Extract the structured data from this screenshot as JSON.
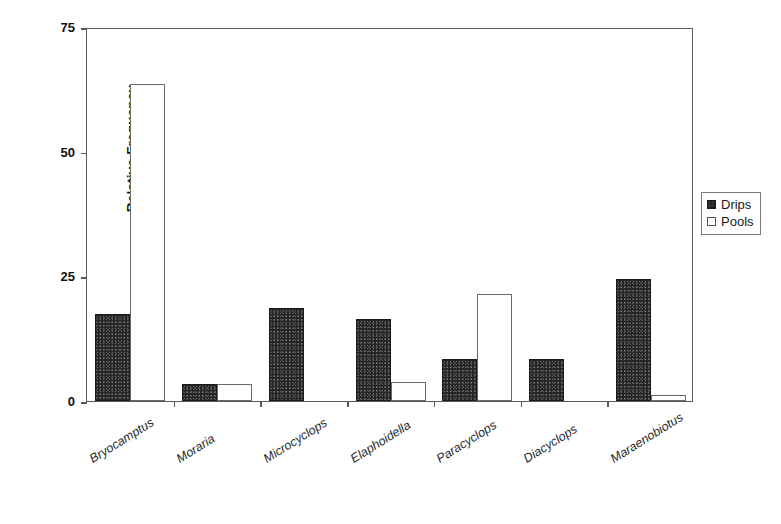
{
  "chart_data": {
    "type": "bar",
    "title": "",
    "xlabel": "",
    "ylabel": "Relative Frequency",
    "ylim": [
      0,
      75
    ],
    "yticks": [
      0,
      25,
      50,
      75
    ],
    "ytick_labels": [
      "0",
      "25",
      "50",
      "75"
    ],
    "grid": false,
    "legend_position": "right",
    "categories": [
      "Bryocamptus",
      "Moraria",
      "Microcyclops",
      "Elaphoidella",
      "Paracyclops",
      "Diacyclops",
      "Maraenobiotus"
    ],
    "series": [
      {
        "name": "Drips",
        "color": "#262626",
        "fill": "filled",
        "values": [
          17.5,
          3.4,
          18.6,
          16.4,
          8.4,
          8.4,
          24.5
        ]
      },
      {
        "name": "Pools",
        "color": "#ffffff",
        "fill": "hollow",
        "values": [
          63.5,
          3.4,
          0,
          3.8,
          21.5,
          0,
          1.2
        ]
      }
    ]
  },
  "axes": {
    "y_label": "Relative Frequency"
  },
  "legend": {
    "entries": [
      {
        "label": "Drips",
        "swatch": "filled-square-icon"
      },
      {
        "label": "Pools",
        "swatch": "hollow-square-icon"
      }
    ]
  }
}
